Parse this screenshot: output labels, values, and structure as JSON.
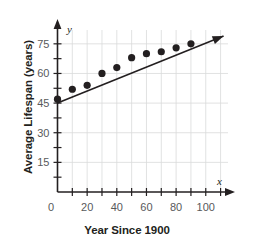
{
  "chart_data": {
    "type": "scatter",
    "title": "",
    "xlabel": "Year Since 1900",
    "ylabel": "Average Lifespan (years)",
    "x_axis_symbol": "x",
    "y_axis_symbol": "y",
    "xlim": [
      0,
      115
    ],
    "ylim": [
      0,
      82
    ],
    "grid": true,
    "legend": "none",
    "x_tick_labels": [
      "0",
      "20",
      "40",
      "60",
      "80",
      "100"
    ],
    "x_tick_values": [
      0,
      20,
      40,
      60,
      80,
      100
    ],
    "x_minor_ticks": [
      10,
      30,
      50,
      70,
      90,
      110
    ],
    "y_tick_labels": [
      "15",
      "30",
      "45",
      "60",
      "75"
    ],
    "y_tick_values": [
      15,
      30,
      45,
      60,
      75
    ],
    "y_minor_ticks": [
      7.5,
      22.5,
      37.5,
      52.5,
      67.5
    ],
    "series": [
      {
        "name": "Average lifespan data",
        "type": "scatter",
        "marker": "filled-circle",
        "color": "#231f20",
        "x": [
          0,
          10,
          20,
          30,
          40,
          50,
          60,
          70,
          80,
          90
        ],
        "values": [
          47,
          52,
          54,
          60,
          63,
          68,
          70,
          71,
          73,
          75
        ]
      },
      {
        "name": "Line of best fit",
        "type": "line",
        "color": "#231f20",
        "x": [
          0,
          112
        ],
        "values": [
          45,
          79
        ]
      }
    ]
  }
}
